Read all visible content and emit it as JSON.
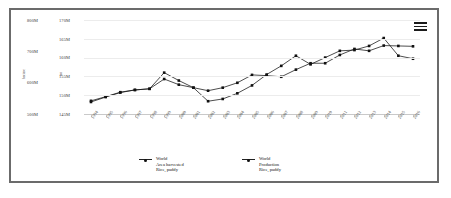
{
  "menu": {
    "icon": "hamburger-menu-icon"
  },
  "axes": {
    "y1_title": "hectare",
    "y2_title": "ton",
    "y1_ticks": [
      "800M",
      "700M",
      "600M",
      "500M"
    ],
    "y2_ticks": [
      "170M",
      "165M",
      "160M",
      "155M",
      "150M",
      "145M"
    ]
  },
  "legend": {
    "entries": [
      {
        "line1": "World",
        "line2": "Area harvested",
        "line3": "Rice, paddy"
      },
      {
        "line1": "World",
        "line2": "Production",
        "line3": "Rice, paddy"
      }
    ]
  },
  "chart_data": {
    "type": "line",
    "title": "",
    "xlabel": "",
    "ylabel": "hectare",
    "y2label": "ton",
    "grid": true,
    "legend_position": "bottom",
    "x": [
      "1994",
      "1995",
      "1996",
      "1997",
      "1998",
      "1999",
      "2000",
      "2001",
      "2002",
      "2003",
      "2004",
      "2005",
      "2006",
      "2007",
      "2008",
      "2009",
      "2010",
      "2011",
      "2012",
      "2013",
      "2014",
      "2015",
      "2016"
    ],
    "y1_axis": {
      "label": "hectare",
      "ticks": [
        "800M",
        "700M",
        "600M",
        "500M"
      ],
      "ylim": [
        500000000,
        800000000
      ]
    },
    "y2_axis": {
      "label": "ton",
      "ticks": [
        "170M",
        "165M",
        "160M",
        "155M",
        "150M",
        "145M"
      ],
      "ylim": [
        145000000,
        170000000
      ]
    },
    "series": [
      {
        "name": "World Area harvested Rice, paddy",
        "axis": "y2",
        "unit": "ha",
        "values": [
          148.5,
          149.6,
          150.8,
          151.4,
          151.7,
          154.3,
          152.8,
          152.0,
          151.2,
          152.0,
          153.3,
          155.4,
          155.2,
          154.9,
          156.8,
          158.5,
          158.5,
          160.7,
          162.3,
          161.8,
          163.2,
          163.1,
          163.0
        ]
      },
      {
        "name": "World Production Rice, paddy",
        "axis": "y2",
        "unit": "t",
        "values": [
          148.2,
          149.5,
          150.7,
          151.4,
          151.7,
          156.0,
          153.9,
          152.0,
          148.4,
          149.0,
          150.5,
          152.6,
          155.5,
          157.8,
          160.5,
          158.2,
          160.0,
          161.8,
          162.0,
          163.1,
          165.2,
          160.5,
          159.7
        ]
      }
    ]
  }
}
